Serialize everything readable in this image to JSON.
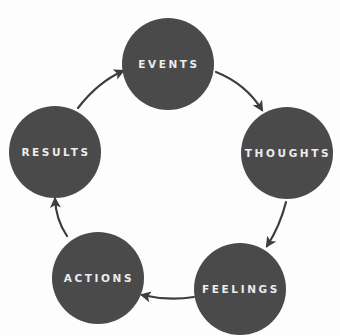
{
  "diagram": {
    "type": "cycle",
    "colors": {
      "background": "#fdfdfd",
      "node_fill": "#4a4a4a",
      "node_text": "#ececec",
      "arrow": "#3d3d3d"
    },
    "nodes": [
      {
        "id": "events",
        "label": "EVENTS",
        "cx": 168,
        "cy": 64,
        "r": 46
      },
      {
        "id": "thoughts",
        "label": "THOUGHTS",
        "cx": 287,
        "cy": 153,
        "r": 46
      },
      {
        "id": "feelings",
        "label": "FEELINGS",
        "cx": 240,
        "cy": 289,
        "r": 46
      },
      {
        "id": "actions",
        "label": "ACTIONS",
        "cx": 98,
        "cy": 278,
        "r": 46
      },
      {
        "id": "results",
        "label": "RESULTS",
        "cx": 55,
        "cy": 152,
        "r": 46
      }
    ],
    "edges": [
      {
        "from": "events",
        "to": "thoughts",
        "path": "M 216 72 Q 246 84 262 110"
      },
      {
        "from": "thoughts",
        "to": "feelings",
        "path": "M 286 202 Q 280 226 267 246"
      },
      {
        "from": "feelings",
        "to": "actions",
        "path": "M 194 297 Q 168 301 142 295"
      },
      {
        "from": "actions",
        "to": "results",
        "path": "M 67 236 Q 56 220 55 199"
      },
      {
        "from": "results",
        "to": "events",
        "path": "M 78 108 Q 98 82 123 71"
      }
    ]
  }
}
